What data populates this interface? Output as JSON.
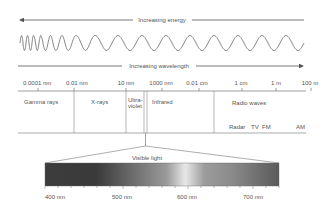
{
  "diagram": {
    "energy_arrow": {
      "label": "Increasing energy",
      "direction": "left"
    },
    "wavelength_arrow": {
      "label": "Increasing wavelength",
      "direction": "right"
    },
    "scale_ticks": [
      {
        "label": "0.0001 nm",
        "x": 38
      },
      {
        "label": "0.01 nm",
        "x": 74
      },
      {
        "label": "10 nm",
        "x": 126
      },
      {
        "label": "1000 nm",
        "x": 162
      },
      {
        "label": "0.01 cm",
        "x": 199
      },
      {
        "label": "1 cm",
        "x": 242
      },
      {
        "label": "1 m",
        "x": 276
      },
      {
        "label": "100 m",
        "x": 311
      }
    ],
    "bands": [
      {
        "name": "Gamma rays"
      },
      {
        "name": "X-rays"
      },
      {
        "name": "Ultra-",
        "name2": "violet"
      },
      {
        "name": "Infrared"
      },
      {
        "name": "Radio waves"
      }
    ],
    "radio_subbands": [
      "Radar",
      "TV",
      "FM",
      "AM"
    ],
    "visible": {
      "label": "Visible light",
      "ticks": [
        "400 nm",
        "500 nm",
        "600 nm",
        "700 nm"
      ]
    },
    "colors": {
      "line": "#777777",
      "text": "#555555",
      "gradient_dark": "#3a3a3a",
      "gradient_light": "#e6e6e6"
    }
  }
}
